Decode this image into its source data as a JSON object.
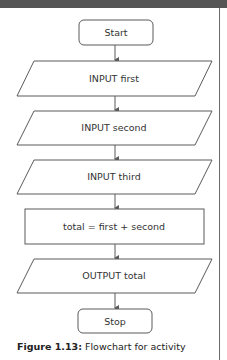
{
  "colors": {
    "topbar": "#555555",
    "stroke": "#5a5a5a",
    "text": "#333333"
  },
  "flowchart": {
    "nodes": [
      {
        "id": "start",
        "shape": "terminator",
        "label": "Start"
      },
      {
        "id": "input-first",
        "shape": "parallelogram",
        "label": "INPUT first"
      },
      {
        "id": "input-second",
        "shape": "parallelogram",
        "label": "INPUT second"
      },
      {
        "id": "input-third",
        "shape": "parallelogram",
        "label": "INPUT third"
      },
      {
        "id": "process-total",
        "shape": "rectangle",
        "label": "total = first + second"
      },
      {
        "id": "output-total",
        "shape": "parallelogram",
        "label": "OUTPUT total"
      },
      {
        "id": "stop",
        "shape": "terminator",
        "label": "Stop"
      }
    ],
    "edges": [
      [
        "start",
        "input-first"
      ],
      [
        "input-first",
        "input-second"
      ],
      [
        "input-second",
        "input-third"
      ],
      [
        "input-third",
        "process-total"
      ],
      [
        "process-total",
        "output-total"
      ],
      [
        "output-total",
        "stop"
      ]
    ]
  },
  "caption": {
    "figure_label": "Figure 1.13:",
    "text": " Flowchart for activity"
  }
}
